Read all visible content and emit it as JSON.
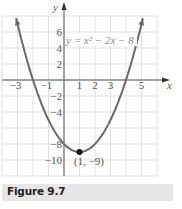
{
  "chart_data": {
    "type": "line",
    "title": "",
    "equation_label": "y = x² − 2x − 8",
    "function": "x^2 - 2x - 8",
    "xlabel": "x",
    "ylabel": "y",
    "xlim": [
      -4,
      6
    ],
    "ylim": [
      -12,
      8
    ],
    "grid": true,
    "grid_x_step": 1,
    "grid_y_step": 2,
    "x_tick_labels": [
      "-3",
      "-1",
      "1",
      "2",
      "3",
      "5"
    ],
    "x_tick_values": [
      -3,
      -1,
      1,
      2,
      3,
      5
    ],
    "y_tick_labels": [
      "6",
      "4",
      "2",
      "-2",
      "-4",
      "-8",
      "-10"
    ],
    "y_tick_values": [
      6,
      4,
      2,
      -2,
      -4,
      -8,
      -10
    ],
    "series": [
      {
        "name": "y = x² − 2x − 8",
        "x": [
          -3.09,
          -3,
          -2,
          -1,
          0,
          1,
          2,
          3,
          4,
          5,
          5.09
        ],
        "y": [
          7.75,
          7,
          0,
          -5,
          -8,
          -9,
          -8,
          -5,
          0,
          7,
          7.75
        ]
      }
    ],
    "annotations": [
      {
        "type": "point",
        "x": 1,
        "y": -9,
        "label": "(1, −9)"
      }
    ]
  },
  "caption": "Figure 9.7",
  "colors": {
    "curve": "#6b6b6b",
    "grid": "#d9d9d9",
    "axis": "#555555",
    "caption_bg": "#e6e6e6",
    "text": "#333333"
  }
}
